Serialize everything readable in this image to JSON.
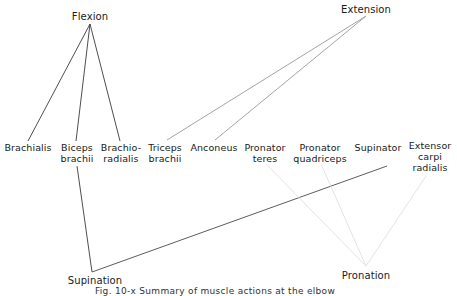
{
  "diagram": {
    "caption": "Fig. 10-x  Summary of muscle actions at the elbow",
    "actions": [
      {
        "id": "flexion",
        "label": "Flexion",
        "x": 90,
        "y": 11,
        "anchor": [
          90,
          24
        ],
        "line_color": "#3a3a3a"
      },
      {
        "id": "extension",
        "label": "Extension",
        "x": 366,
        "y": 4,
        "anchor": [
          366,
          16
        ],
        "line_color": "#9a9a9a"
      },
      {
        "id": "supination",
        "label": "Supination",
        "x": 95,
        "y": 275,
        "anchor": [
          92,
          272
        ],
        "line_color": "#3a3a3a"
      },
      {
        "id": "pronation",
        "label": "Pronation",
        "x": 366,
        "y": 270,
        "anchor": [
          366,
          266
        ],
        "line_color": "#e3e3e3"
      }
    ],
    "muscles": [
      {
        "id": "brachialis",
        "label": "Brachialis",
        "x": 28,
        "y": 142
      },
      {
        "id": "biceps-brachii",
        "label": "Biceps\nbrachii",
        "x": 77,
        "y": 142
      },
      {
        "id": "brachioradialis",
        "label": "Brachio-\nradialis",
        "x": 121,
        "y": 142
      },
      {
        "id": "triceps-brachii",
        "label": "Triceps\nbrachii",
        "x": 165,
        "y": 142
      },
      {
        "id": "anconeus",
        "label": "Anconeus",
        "x": 214,
        "y": 142
      },
      {
        "id": "pronator-teres",
        "label": "Pronator\nteres",
        "x": 265,
        "y": 142
      },
      {
        "id": "pronator-quadriceps",
        "label": "Pronator\nquadriceps",
        "x": 320,
        "y": 142
      },
      {
        "id": "supinator",
        "label": "Supinator",
        "x": 378,
        "y": 142
      },
      {
        "id": "extensor-carpi-radialis",
        "label": "Extensor\ncarpi\nradialis",
        "x": 430,
        "y": 140
      }
    ],
    "connections": [
      {
        "from": "flexion",
        "to": "brachialis",
        "p1": [
          90,
          24
        ],
        "p2": [
          28,
          141
        ],
        "color": "#3a3a3a"
      },
      {
        "from": "flexion",
        "to": "biceps-brachii",
        "p1": [
          90,
          24
        ],
        "p2": [
          76,
          141
        ],
        "color": "#3a3a3a"
      },
      {
        "from": "flexion",
        "to": "brachioradialis",
        "p1": [
          90,
          24
        ],
        "p2": [
          120,
          141
        ],
        "color": "#3a3a3a"
      },
      {
        "from": "extension",
        "to": "triceps-brachii",
        "p1": [
          366,
          16
        ],
        "p2": [
          167,
          140
        ],
        "color": "#9a9a9a"
      },
      {
        "from": "extension",
        "to": "anconeus",
        "p1": [
          366,
          16
        ],
        "p2": [
          215,
          140
        ],
        "color": "#9a9a9a"
      },
      {
        "from": "supination",
        "to": "biceps-brachii",
        "p1": [
          92,
          272
        ],
        "p2": [
          77,
          166
        ],
        "color": "#3a3a3a"
      },
      {
        "from": "supination",
        "to": "supinator",
        "p1": [
          92,
          272
        ],
        "p2": [
          387,
          166
        ],
        "color": "#4a4a4a"
      },
      {
        "from": "pronation",
        "to": "pronator-teres",
        "p1": [
          366,
          266
        ],
        "p2": [
          266,
          164
        ],
        "color": "#e0e0e0"
      },
      {
        "from": "pronation",
        "to": "pronator-quadriceps",
        "p1": [
          366,
          266
        ],
        "p2": [
          321,
          164
        ],
        "color": "#e0e0e0"
      },
      {
        "from": "pronation",
        "to": "extensor-carpi-radialis",
        "p1": [
          366,
          266
        ],
        "p2": [
          426,
          176
        ],
        "color": "#e0e0e0"
      }
    ]
  }
}
